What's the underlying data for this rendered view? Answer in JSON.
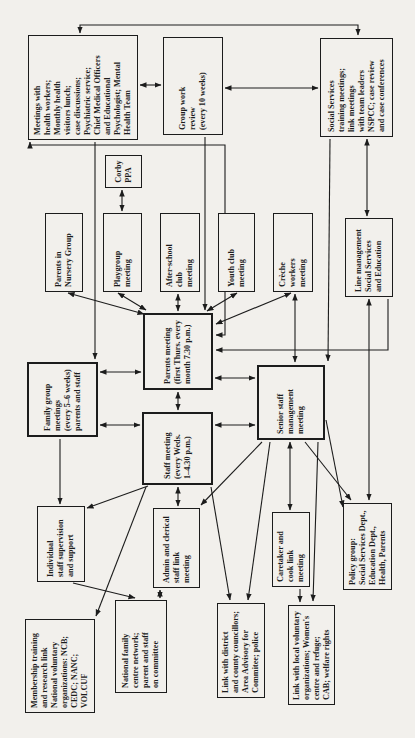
{
  "diagram_title": "Pattern of meetings of a family centre (scanned flowchart, rotated page)",
  "colors": {
    "paper": "#f2f0ec",
    "ink": "#1c1c1c"
  },
  "nodes": {
    "meetings_health": {
      "label": "Meetings with\nhealth workers;\nMonthly health\nvisitors lunch;\ncase discussions;\nPsychiatric service;\nChief Medical Officers\nand Educational\nPsychologist; Mental\nHealth Team"
    },
    "group_work": {
      "label": "Group work\nreview\n(every 10 weeks)"
    },
    "social_services": {
      "label": "Social Services\ntraining meetings;\nlink meetings\nwith team leaders\nNSPCC; case review\nand case conferences"
    },
    "corby_ppa": {
      "label": "Corby\nPPA"
    },
    "parents_nursery": {
      "label": "Parents in\nNursery Group"
    },
    "playgroup": {
      "label": "Playgroup\nmeeting"
    },
    "after_school": {
      "label": "After-school\nclub\nmeeting"
    },
    "youth_club": {
      "label": "Youth club\nmeeting"
    },
    "creche": {
      "label": "Crèche\nworkers\nmeeting"
    },
    "line_mgmt": {
      "label": "Line management\nSocial Services\nand Education"
    },
    "parents_meeting": {
      "label": "Parents meeting\n(first Thurs. every\nmonth 7.30 p.m.)"
    },
    "family_group": {
      "label": "Family group\nmeetings\n(every 5–6 weeks)\nparents and staff"
    },
    "staff_meeting": {
      "label": "Staff meeting\n(every Weds.\n1–4.30 p.m.)"
    },
    "senior_staff": {
      "label": "Senior staff\nmanagement\nmeeting"
    },
    "individual_staff": {
      "label": "Individual\nstaff supervision\nand support"
    },
    "admin_clerical": {
      "label": "Admin and clerical\nstaff link\nmeeting"
    },
    "caretaker": {
      "label": "Caretaker and\ncook link\nmeeting"
    },
    "policy_group": {
      "label": "Policy group:\nSocial Services Dept.,\nEducation Dept.,\nHealth, Parents"
    },
    "membership": {
      "label": "Membership training\nand research link\nNational voluntary\norganizations: NCB;\nCEDC; NANC;\nVOLCUF"
    },
    "national_family": {
      "label": "National family\ncentre network;\nparent and staff\non committee"
    },
    "link_district": {
      "label": "Link with district\nand county councillors;\nArea Advisory for\nCommitee; police"
    },
    "link_local": {
      "label": "Link with local voluntary\norganizations; Women's\ncentre and refuge;\nCAB; welfare rights"
    }
  },
  "connections": [
    {
      "from": "meetings_health",
      "to": "group_work",
      "arrows": "both"
    },
    {
      "from": "group_work",
      "to": "social_services",
      "arrows": "both"
    },
    {
      "from": "meetings_health",
      "to": "social_services",
      "arrows": "both"
    },
    {
      "from": "social_services",
      "to": "line_mgmt",
      "arrows": "both"
    },
    {
      "from": "group_work",
      "to": "parents_meeting",
      "arrows": "end"
    },
    {
      "from": "after_school",
      "to": "parents_meeting",
      "arrows": "both"
    },
    {
      "from": "playgroup",
      "to": "parents_meeting",
      "arrows": "both"
    },
    {
      "from": "parents_nursery",
      "to": "parents_meeting",
      "arrows": "both"
    },
    {
      "from": "youth_club",
      "to": "parents_meeting",
      "arrows": "both"
    },
    {
      "from": "creche",
      "to": "parents_meeting",
      "arrows": "both"
    },
    {
      "from": "corby_ppa",
      "to": "playgroup",
      "arrows": "both"
    },
    {
      "from": "parents_meeting",
      "to": "staff_meeting",
      "arrows": "both"
    },
    {
      "from": "family_group",
      "to": "parents_meeting",
      "arrows": "both"
    },
    {
      "from": "family_group",
      "to": "staff_meeting",
      "arrows": "both"
    },
    {
      "from": "meetings_health",
      "to": "family_group",
      "arrows": "end"
    },
    {
      "from": "meetings_health",
      "to": "parents_meeting",
      "arrows": "both"
    },
    {
      "from": "social_services",
      "to": "senior_staff",
      "arrows": "end"
    },
    {
      "from": "senior_staff",
      "to": "parents_meeting",
      "arrows": "both"
    },
    {
      "from": "staff_meeting",
      "to": "senior_staff",
      "arrows": "both"
    },
    {
      "from": "staff_meeting",
      "to": "admin_clerical",
      "arrows": "both"
    },
    {
      "from": "family_group",
      "to": "individual_staff",
      "arrows": "end"
    },
    {
      "from": "staff_meeting",
      "to": "individual_staff",
      "arrows": "end"
    },
    {
      "from": "senior_staff",
      "to": "caretaker",
      "arrows": "both"
    },
    {
      "from": "senior_staff",
      "to": "policy_group",
      "arrows": "end"
    },
    {
      "from": "senior_staff",
      "to": "policy_group",
      "arrows": "end"
    },
    {
      "from": "senior_staff",
      "to": "admin_clerical",
      "arrows": "end"
    },
    {
      "from": "senior_staff",
      "to": "link_local",
      "arrows": "end"
    },
    {
      "from": "senior_staff",
      "to": "link_district",
      "arrows": "end"
    },
    {
      "from": "admin_clerical",
      "to": "national_family",
      "arrows": "both"
    },
    {
      "from": "staff_meeting",
      "to": "membership",
      "arrows": "end"
    },
    {
      "from": "individual_staff",
      "to": "national_family",
      "arrows": "end"
    },
    {
      "from": "line_mgmt",
      "to": "policy_group",
      "arrows": "both"
    },
    {
      "from": "caretaker",
      "to": "link_local",
      "arrows": "end"
    },
    {
      "from": "line_mgmt",
      "to": "parents_meeting",
      "arrows": "start"
    },
    {
      "from": "staff_meeting",
      "to": "link_district",
      "arrows": "end"
    },
    {
      "from": "creche",
      "to": "senior_staff",
      "arrows": "both"
    }
  ]
}
